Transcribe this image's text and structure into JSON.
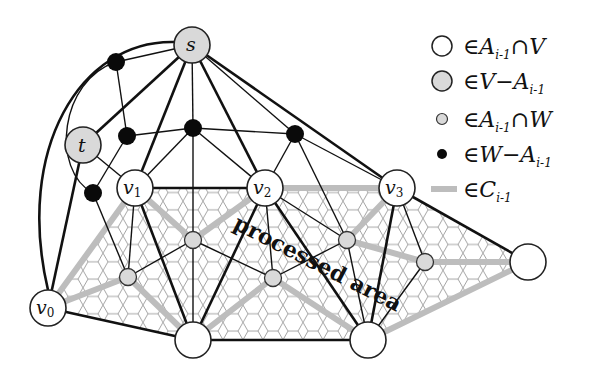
{
  "diagram": {
    "title": "",
    "colors": {
      "edge": "#111111",
      "cycle_edge": "#bdbdbd",
      "hex_mesh": "#9a9a9a",
      "white_node": "#ffffff",
      "gray_node": "#d9d9d9",
      "black_node": "#0a0a0a"
    },
    "area_label": "processed area",
    "nodes": {
      "s": {
        "label": "s",
        "x": 192,
        "y": 45,
        "r": 18,
        "kind": "V-A"
      },
      "t": {
        "label": "t",
        "x": 83,
        "y": 145,
        "r": 18,
        "kind": "V-A"
      },
      "v0": {
        "label": "v",
        "sub": "0",
        "x": 48,
        "y": 308,
        "r": 18,
        "kind": "A∩V"
      },
      "v1": {
        "label": "v",
        "sub": "1",
        "x": 135,
        "y": 188,
        "r": 18,
        "kind": "A∩V"
      },
      "v2": {
        "label": "v",
        "sub": "2",
        "x": 265,
        "y": 188,
        "r": 18,
        "kind": "A∩V"
      },
      "v3": {
        "label": "v",
        "sub": "3",
        "x": 397,
        "y": 188,
        "r": 18,
        "kind": "A∩V"
      },
      "b1": {
        "label": "",
        "x": 193,
        "y": 340,
        "r": 18,
        "kind": "A∩V"
      },
      "b2": {
        "label": "",
        "x": 368,
        "y": 340,
        "r": 18,
        "kind": "A∩V"
      },
      "r1": {
        "label": "",
        "x": 528,
        "y": 262,
        "r": 18,
        "kind": "A∩V"
      }
    },
    "legend": [
      {
        "symbol": "white-circle",
        "text_prefix": "∈",
        "text": "A",
        "sub": "i-1",
        "suffix": "∩V"
      },
      {
        "symbol": "gray-circle",
        "text_prefix": "∈",
        "text": "V−A",
        "sub": "i-1",
        "suffix": ""
      },
      {
        "symbol": "small-gray-circle",
        "text_prefix": "∈",
        "text": "A",
        "sub": "i-1",
        "suffix": "∩W"
      },
      {
        "symbol": "black-dot",
        "text_prefix": "∈",
        "text": "W−A",
        "sub": "i-1",
        "suffix": ""
      },
      {
        "symbol": "gray-bar",
        "text_prefix": "∈",
        "text": "C",
        "sub": "i-1",
        "suffix": ""
      }
    ]
  }
}
